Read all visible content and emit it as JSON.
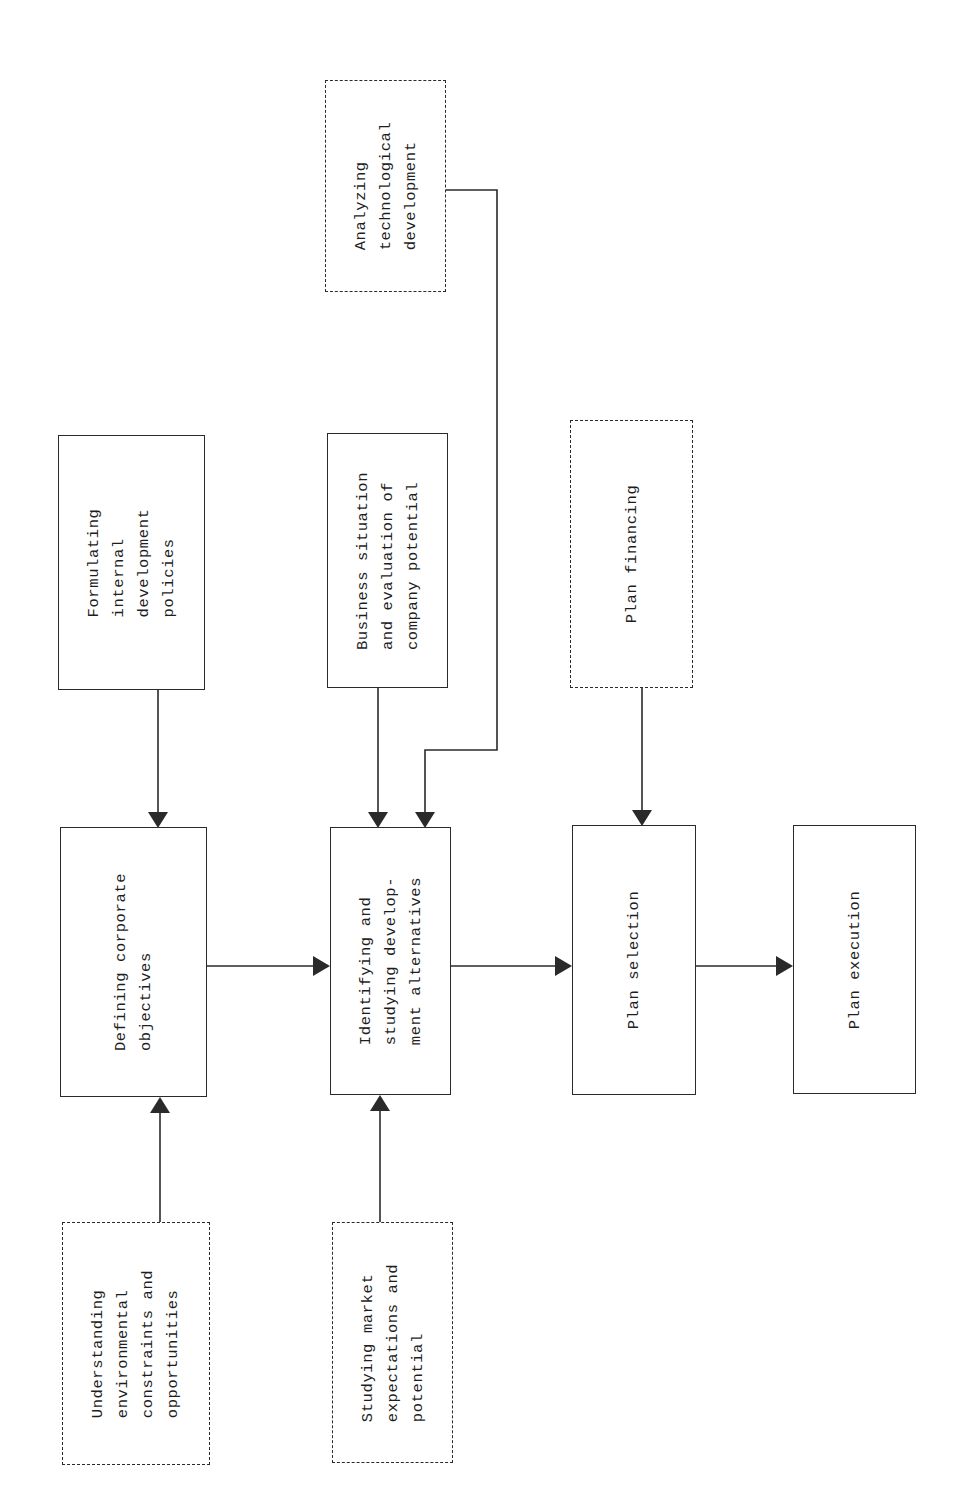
{
  "diagram": {
    "type": "flowchart",
    "orientation": "rotated-90-ccw",
    "legend": {
      "solid_box": "process step",
      "dashed_box": "input / supporting activity"
    },
    "nodes": {
      "analyzing_tech": {
        "label": "Analyzing\ntechnological\ndevelopment",
        "style": "dashed"
      },
      "formulating_policies": {
        "label": "Formulating\ninternal\ndevelopment\npolicies",
        "style": "solid"
      },
      "business_situation": {
        "label": "Business situation\nand evaluation of\ncompany potential",
        "style": "solid"
      },
      "plan_financing": {
        "label": "Plan financing",
        "style": "dashed"
      },
      "defining_objectives": {
        "label": "Defining corporate\nobjectives",
        "style": "solid"
      },
      "identifying_alternatives": {
        "label": "Identifying and\nstudying develop-\nment alternatives",
        "style": "solid"
      },
      "plan_selection": {
        "label": "Plan selection",
        "style": "solid"
      },
      "plan_execution": {
        "label": "Plan execution",
        "style": "solid"
      },
      "understanding_env": {
        "label": "Understanding\nenvironmental\nconstraints and\nopportunities",
        "style": "dashed"
      },
      "studying_market": {
        "label": "Studying market\nexpectations and\npotential",
        "style": "dashed"
      }
    },
    "edges": [
      {
        "from": "formulating_policies",
        "to": "defining_objectives"
      },
      {
        "from": "understanding_env",
        "to": "defining_objectives"
      },
      {
        "from": "defining_objectives",
        "to": "identifying_alternatives"
      },
      {
        "from": "business_situation",
        "to": "identifying_alternatives"
      },
      {
        "from": "analyzing_tech",
        "to": "identifying_alternatives"
      },
      {
        "from": "studying_market",
        "to": "identifying_alternatives"
      },
      {
        "from": "identifying_alternatives",
        "to": "plan_selection"
      },
      {
        "from": "plan_financing",
        "to": "plan_selection"
      },
      {
        "from": "plan_selection",
        "to": "plan_execution"
      }
    ],
    "colors": {
      "line": "#2a2a2a",
      "background": "#ffffff"
    }
  }
}
